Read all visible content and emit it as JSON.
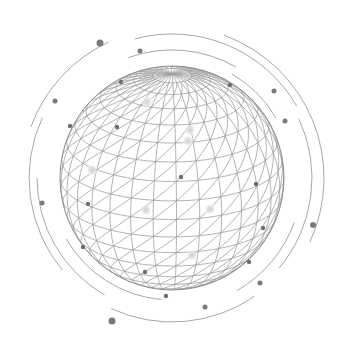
{
  "illustration": {
    "subject": "wireframe-globe",
    "background": "#ffffff",
    "line_color": "#9a9a9a",
    "dot_color": "#6e6e6e",
    "glow_color": "#d9d9d9",
    "globe": {
      "cx": 172,
      "cy": 178,
      "r": 112
    },
    "orbit_dots": [
      {
        "x": 100,
        "y": 43,
        "r": 3.5
      },
      {
        "x": 140,
        "y": 51,
        "r": 2.5
      },
      {
        "x": 55,
        "y": 101,
        "r": 2.5
      },
      {
        "x": 274,
        "y": 91,
        "r": 2.5
      },
      {
        "x": 285,
        "y": 121,
        "r": 2.5
      },
      {
        "x": 42,
        "y": 203,
        "r": 2.5
      },
      {
        "x": 313,
        "y": 225,
        "r": 3
      },
      {
        "x": 260,
        "y": 283,
        "r": 2.5
      },
      {
        "x": 112,
        "y": 321,
        "r": 3.5
      },
      {
        "x": 205,
        "y": 307,
        "r": 2.5
      }
    ],
    "globe_dots": [
      {
        "x": 121,
        "y": 82
      },
      {
        "x": 70,
        "y": 126
      },
      {
        "x": 117,
        "y": 127
      },
      {
        "x": 181,
        "y": 177
      },
      {
        "x": 88,
        "y": 204
      },
      {
        "x": 83,
        "y": 247
      },
      {
        "x": 145,
        "y": 272
      },
      {
        "x": 166,
        "y": 296
      },
      {
        "x": 256,
        "y": 184
      },
      {
        "x": 263,
        "y": 228
      },
      {
        "x": 249,
        "y": 262
      },
      {
        "x": 230,
        "y": 85
      }
    ],
    "glow_dots": [
      {
        "x": 147,
        "y": 102
      },
      {
        "x": 190,
        "y": 130
      },
      {
        "x": 92,
        "y": 170
      },
      {
        "x": 146,
        "y": 210
      },
      {
        "x": 210,
        "y": 209
      },
      {
        "x": 192,
        "y": 255
      },
      {
        "x": 188,
        "y": 141
      }
    ]
  }
}
